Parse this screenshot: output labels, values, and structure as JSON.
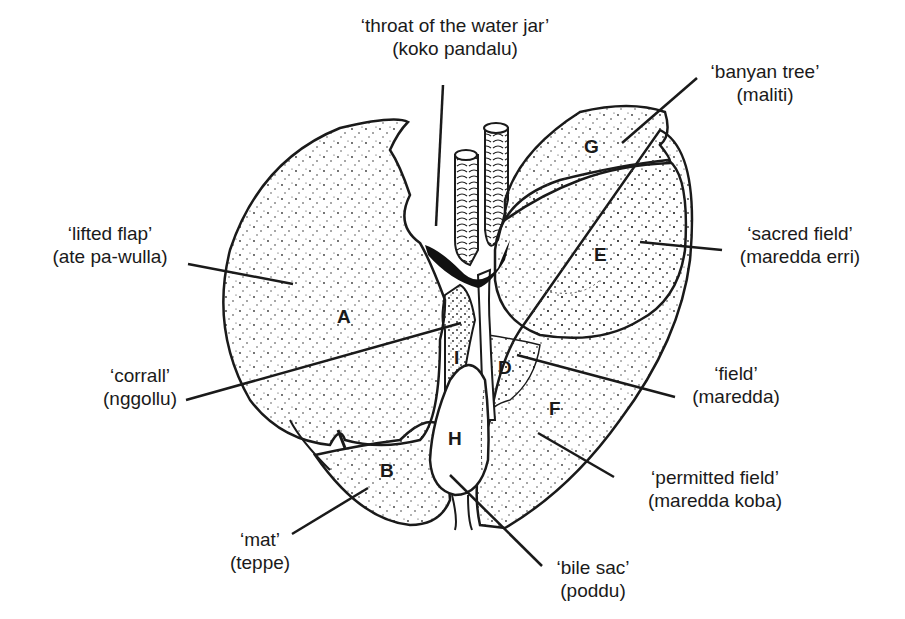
{
  "diagram": {
    "labels": [
      {
        "id": "throat",
        "gloss": "‘throat of the water jar’",
        "term": "(koko pandalu)",
        "x": 310,
        "y": 14,
        "w": 290
      },
      {
        "id": "banyan",
        "gloss": "‘banyan tree’",
        "term": "(maliti)",
        "x": 690,
        "y": 60,
        "w": 150
      },
      {
        "id": "lifted",
        "gloss": "‘lifted flap’",
        "term": "(ate pa-wulla)",
        "x": 30,
        "y": 222,
        "w": 160
      },
      {
        "id": "sacred",
        "gloss": "‘sacred field’",
        "term": "(maredda erri)",
        "x": 720,
        "y": 222,
        "w": 160
      },
      {
        "id": "corrall",
        "gloss": "‘corrall’",
        "term": "(nggollu)",
        "x": 80,
        "y": 364,
        "w": 120
      },
      {
        "id": "field",
        "gloss": "‘field’",
        "term": "(maredda)",
        "x": 676,
        "y": 362,
        "w": 120
      },
      {
        "id": "permitted",
        "gloss": "‘permitted field’",
        "term": "(maredda koba)",
        "x": 620,
        "y": 466,
        "w": 190
      },
      {
        "id": "mat",
        "gloss": "‘mat’",
        "term": "(teppe)",
        "x": 210,
        "y": 528,
        "w": 100
      },
      {
        "id": "bile",
        "gloss": "‘bile sac’",
        "term": "(poddu)",
        "x": 538,
        "y": 556,
        "w": 110
      }
    ],
    "regions": [
      {
        "letter": "A",
        "x": 337,
        "y": 306
      },
      {
        "letter": "B",
        "x": 380,
        "y": 460
      },
      {
        "letter": "D",
        "x": 498,
        "y": 357
      },
      {
        "letter": "E",
        "x": 594,
        "y": 244
      },
      {
        "letter": "F",
        "x": 549,
        "y": 398
      },
      {
        "letter": "G",
        "x": 584,
        "y": 136
      },
      {
        "letter": "H",
        "x": 448,
        "y": 428
      },
      {
        "letter": "I",
        "x": 454,
        "y": 347
      }
    ],
    "colors": {
      "ink": "#1a1a1a",
      "paper": "#ffffff",
      "stipple": "#333333"
    }
  }
}
